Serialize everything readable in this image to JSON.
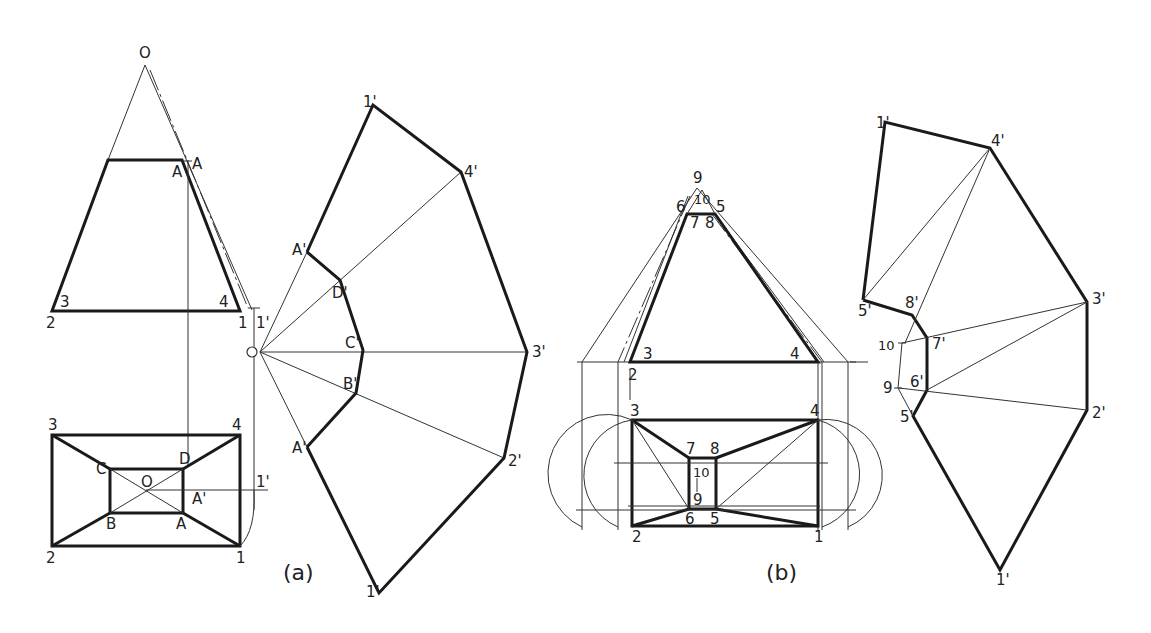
{
  "figure": {
    "panels": [
      {
        "caption": "(a)",
        "front_view": {
          "apex": "O",
          "top_labels": [
            "A",
            "A"
          ],
          "bottom_labels": [
            "2",
            "3",
            "4",
            "1",
            "1'"
          ]
        },
        "top_view": {
          "outer_corners": [
            "3",
            "4",
            "2",
            "1"
          ],
          "inner_corners": [
            "C",
            "D",
            "B",
            "A"
          ],
          "center": "O",
          "extra": [
            "A'",
            "1'"
          ]
        },
        "development": {
          "center": "O",
          "outer": [
            "1'",
            "4'",
            "3'",
            "2'",
            "1'"
          ],
          "inner": [
            "A'",
            "D'",
            "C'",
            "B'",
            "A'"
          ]
        }
      },
      {
        "caption": "(b)",
        "front_view": {
          "top_labels": [
            "9",
            "10",
            "6",
            "5",
            "7",
            "8"
          ],
          "bottom_labels": [
            "3",
            "4",
            "2"
          ]
        },
        "top_view": {
          "outer_corners": [
            "3",
            "4",
            "2",
            "1"
          ],
          "inner_corners": [
            "7",
            "8",
            "6",
            "5"
          ],
          "extra": [
            "10",
            "9"
          ]
        },
        "development": {
          "outer": [
            "1'",
            "4'",
            "3'",
            "2'",
            "1'"
          ],
          "inner": [
            "5'",
            "8'",
            "7'",
            "6'",
            "5'"
          ],
          "extra": [
            "10",
            "9"
          ]
        }
      }
    ]
  }
}
